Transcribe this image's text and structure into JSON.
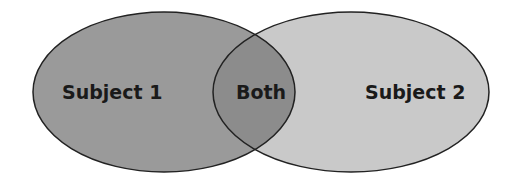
{
  "diagram": {
    "type": "venn",
    "sets": [
      {
        "label": "Subject 1",
        "color": "#9a9a9a"
      },
      {
        "label": "Subject 2",
        "color": "#c9c9c9"
      }
    ],
    "overlap": {
      "label": "Both",
      "color": "#8a8a8a"
    },
    "stroke": "#222222"
  }
}
